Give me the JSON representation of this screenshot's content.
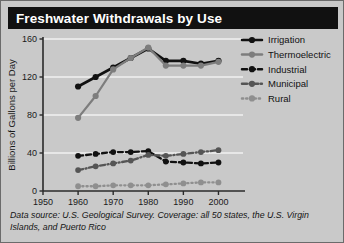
{
  "card": {
    "background": "#c9c9c9",
    "border_color": "#6b6b6b"
  },
  "title": {
    "text": "Freshwater Withdrawals by Use",
    "bar_color": "#111111",
    "text_color": "#ffffff"
  },
  "footer": {
    "text": "Data source: U.S. Geological Survey. Coverage: all 50 states, the U.S. Virgin Islands, and Puerto Rico"
  },
  "legend": {
    "position": "right",
    "items": [
      {
        "label": "Irrigation",
        "color": "#111111",
        "dash": "solid"
      },
      {
        "label": "Thermoelectric",
        "color": "#7d7d7d",
        "dash": "solid"
      },
      {
        "label": "Industrial",
        "color": "#111111",
        "dash": "dashed"
      },
      {
        "label": "Municipal",
        "color": "#555555",
        "dash": "dashdot"
      },
      {
        "label": "Rural",
        "color": "#8f8f8f",
        "dash": "dotted"
      }
    ]
  },
  "chart_data": {
    "type": "line",
    "title": "Freshwater Withdrawals by Use",
    "xlabel": "",
    "ylabel": "Billions of Gallons per Day",
    "x": [
      1960,
      1965,
      1970,
      1975,
      1980,
      1985,
      1990,
      1995,
      2000
    ],
    "xlim": [
      1950,
      2003
    ],
    "ylim": [
      0,
      160
    ],
    "xticks": [
      1950,
      1960,
      1970,
      1980,
      1990,
      2000
    ],
    "xticklabels": [
      "1950",
      "1960",
      "1970",
      "1980",
      "1990",
      "2000"
    ],
    "yticks": [
      0,
      40,
      80,
      120,
      160
    ],
    "yticklabels": [
      "0",
      "40",
      "80",
      "120",
      "160"
    ],
    "grid": "horizontal",
    "series": [
      {
        "name": "Irrigation",
        "color": "#111111",
        "dash": "solid",
        "values": [
          110,
          120,
          130,
          140,
          150,
          137,
          137,
          134,
          137
        ]
      },
      {
        "name": "Thermoelectric",
        "color": "#7d7d7d",
        "dash": "solid",
        "values": [
          77,
          100,
          128,
          140,
          151,
          132,
          132,
          132,
          136
        ]
      },
      {
        "name": "Industrial",
        "color": "#111111",
        "dash": "dashed",
        "values": [
          37,
          39,
          41,
          41,
          42,
          31,
          30,
          29,
          30
        ]
      },
      {
        "name": "Municipal",
        "color": "#555555",
        "dash": "dashdot",
        "values": [
          22,
          26,
          29,
          32,
          38,
          37,
          39,
          41,
          43
        ]
      },
      {
        "name": "Rural",
        "color": "#8f8f8f",
        "dash": "dotted",
        "values": [
          5,
          5,
          6,
          6,
          6,
          7,
          8,
          9,
          9
        ]
      }
    ]
  }
}
